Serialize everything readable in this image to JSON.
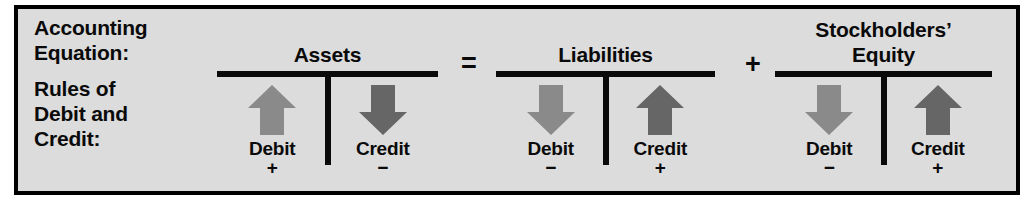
{
  "figure": {
    "background_color": "#dcdcdc",
    "border_color": "#000000",
    "row_labels": {
      "accounting_equation": [
        "Accounting",
        "Equation:"
      ],
      "rules": [
        "Rules of",
        "Debit and",
        "Credit:"
      ]
    },
    "operators": {
      "equals": "=",
      "plus": "+"
    },
    "accounts": [
      {
        "title_lines": [
          "Assets"
        ],
        "debit": {
          "label": "Debit",
          "sign": "+",
          "arrow_direction": "up",
          "arrow_color": "#8a8a8a"
        },
        "credit": {
          "label": "Credit",
          "sign": "−",
          "arrow_direction": "down",
          "arrow_color": "#666666"
        }
      },
      {
        "title_lines": [
          "Liabilities"
        ],
        "debit": {
          "label": "Debit",
          "sign": "−",
          "arrow_direction": "down",
          "arrow_color": "#8a8a8a"
        },
        "credit": {
          "label": "Credit",
          "sign": "+",
          "arrow_direction": "up",
          "arrow_color": "#666666"
        }
      },
      {
        "title_lines": [
          "Stockholders’",
          "Equity"
        ],
        "debit": {
          "label": "Debit",
          "sign": "−",
          "arrow_direction": "down",
          "arrow_color": "#8a8a8a"
        },
        "credit": {
          "label": "Credit",
          "sign": "+",
          "arrow_direction": "up",
          "arrow_color": "#666666"
        }
      }
    ]
  }
}
